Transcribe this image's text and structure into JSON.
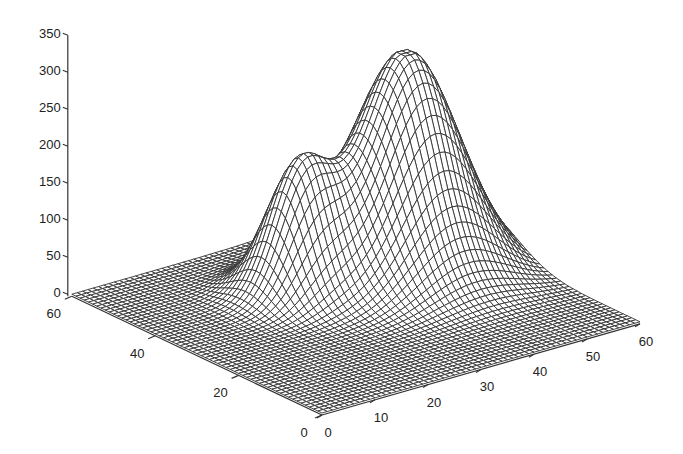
{
  "chart_data": {
    "type": "surface3d",
    "title": "",
    "xlabel": "",
    "ylabel": "",
    "zlabel": "",
    "x_ticks": [
      0,
      10,
      20,
      30,
      40,
      50,
      60
    ],
    "y_ticks": [
      0,
      20,
      40,
      60
    ],
    "z_ticks": [
      0,
      50,
      100,
      150,
      200,
      250,
      300,
      350
    ],
    "xlim": [
      0,
      60
    ],
    "ylim": [
      0,
      60
    ],
    "zlim": [
      0,
      350
    ],
    "grid_resolution": 61,
    "mesh_color": "#333333",
    "face_color": "#ffffff",
    "peaks": [
      {
        "name": "large-peak",
        "x_center": 45,
        "y_center": 37,
        "height": 300,
        "sigma": 8,
        "flat_top": 295
      },
      {
        "name": "small-peak",
        "x_center": 27,
        "y_center": 40,
        "height": 160,
        "sigma": 5,
        "flat_top": 160
      }
    ],
    "baseline_z": 0
  }
}
